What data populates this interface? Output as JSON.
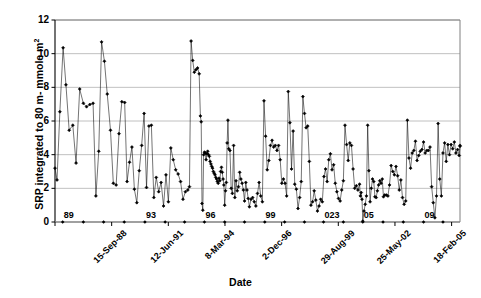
{
  "chart_data": {
    "type": "line",
    "title": "",
    "xlabel": "Date",
    "ylabel": "SRP integrated to 80 m- mmole m2",
    "ylabel_base": "SRP integrated to 80 m- mmole m",
    "ylabel_sup": "2",
    "ylim": [
      0,
      12
    ],
    "ytick_values": [
      0,
      2,
      4,
      6,
      8,
      10,
      12
    ],
    "ytick_labels": [
      "0",
      "2",
      "4",
      "6",
      "8",
      "10",
      "12"
    ],
    "grid": true,
    "grid_axis": "y",
    "legend": "none",
    "marker": "filled-diamond",
    "line_color": "#000000",
    "marker_color": "#000000",
    "grid_color": "#b0b0b0",
    "axis_color": "#808080",
    "xtick_labels": [
      "15-Sep-88",
      "12-Jun-91",
      "8-Mar-94",
      "2-Dec-96",
      "29-Aug-99",
      "25-May-02",
      "18-Feb-05",
      "15-Nov-07"
    ],
    "xtick_positions_frac": [
      0.0,
      0.1399,
      0.2798,
      0.4197,
      0.5596,
      0.6995,
      0.8394,
      0.9793
    ],
    "year_annotations": [
      {
        "label": "89",
        "x_frac": 0.019
      },
      {
        "label": "93",
        "x_frac": 0.222
      },
      {
        "label": "96",
        "x_frac": 0.369
      },
      {
        "label": "99",
        "x_frac": 0.5175
      },
      {
        "label": "023",
        "x_frac": 0.663
      },
      {
        "label": "05",
        "x_frac": 0.76
      },
      {
        "label": "09",
        "x_frac": 0.91
      }
    ],
    "axis_year_ticks_frac": [
      0.019,
      0.07,
      0.12,
      0.171,
      0.222,
      0.272,
      0.32,
      0.369,
      0.419,
      0.468,
      0.518,
      0.567,
      0.616,
      0.663,
      0.712,
      0.76,
      0.81,
      0.86,
      0.91,
      0.958
    ],
    "n_points": 248,
    "x_frac": [
      0.0,
      0.005,
      0.012,
      0.02,
      0.027,
      0.035,
      0.044,
      0.052,
      0.061,
      0.07,
      0.078,
      0.086,
      0.094,
      0.101,
      0.108,
      0.115,
      0.122,
      0.129,
      0.137,
      0.144,
      0.151,
      0.158,
      0.165,
      0.172,
      0.178,
      0.184,
      0.19,
      0.196,
      0.202,
      0.208,
      0.214,
      0.22,
      0.226,
      0.232,
      0.238,
      0.244,
      0.25,
      0.256,
      0.262,
      0.268,
      0.274,
      0.28,
      0.286,
      0.292,
      0.298,
      0.304,
      0.31,
      0.316,
      0.322,
      0.328,
      0.332,
      0.336,
      0.34,
      0.344,
      0.348,
      0.352,
      0.356,
      0.359,
      0.361,
      0.363,
      0.365,
      0.367,
      0.369,
      0.371,
      0.373,
      0.375,
      0.377,
      0.379,
      0.381,
      0.383,
      0.385,
      0.387,
      0.389,
      0.391,
      0.393,
      0.395,
      0.397,
      0.399,
      0.401,
      0.403,
      0.405,
      0.407,
      0.409,
      0.411,
      0.413,
      0.415,
      0.417,
      0.419,
      0.421,
      0.423,
      0.425,
      0.427,
      0.429,
      0.432,
      0.435,
      0.438,
      0.441,
      0.444,
      0.447,
      0.45,
      0.453,
      0.456,
      0.459,
      0.462,
      0.465,
      0.468,
      0.471,
      0.474,
      0.477,
      0.48,
      0.484,
      0.488,
      0.492,
      0.496,
      0.5,
      0.504,
      0.508,
      0.512,
      0.516,
      0.52,
      0.524,
      0.528,
      0.532,
      0.536,
      0.54,
      0.544,
      0.548,
      0.552,
      0.556,
      0.56,
      0.564,
      0.568,
      0.572,
      0.576,
      0.58,
      0.584,
      0.588,
      0.592,
      0.596,
      0.6,
      0.604,
      0.608,
      0.612,
      0.616,
      0.62,
      0.624,
      0.628,
      0.632,
      0.636,
      0.64,
      0.644,
      0.648,
      0.652,
      0.656,
      0.66,
      0.664,
      0.668,
      0.672,
      0.676,
      0.68,
      0.684,
      0.688,
      0.692,
      0.696,
      0.7,
      0.704,
      0.708,
      0.712,
      0.716,
      0.72,
      0.724,
      0.728,
      0.732,
      0.736,
      0.74,
      0.744,
      0.748,
      0.752,
      0.754,
      0.756,
      0.758,
      0.76,
      0.763,
      0.766,
      0.769,
      0.772,
      0.775,
      0.778,
      0.781,
      0.784,
      0.787,
      0.79,
      0.793,
      0.796,
      0.799,
      0.802,
      0.805,
      0.808,
      0.811,
      0.814,
      0.818,
      0.822,
      0.826,
      0.83,
      0.834,
      0.838,
      0.842,
      0.846,
      0.85,
      0.854,
      0.858,
      0.862,
      0.866,
      0.87,
      0.874,
      0.878,
      0.882,
      0.886,
      0.89,
      0.894,
      0.898,
      0.902,
      0.906,
      0.91,
      0.914,
      0.918,
      0.922,
      0.926,
      0.93,
      0.934,
      0.938,
      0.942,
      0.946,
      0.95,
      0.954,
      0.958,
      0.962,
      0.966,
      0.97,
      0.974,
      0.978,
      0.982,
      0.986,
      0.99,
      0.994,
      0.998,
      1.0,
      1.0
    ],
    "values": [
      3.2,
      2.5,
      6.55,
      10.35,
      8.15,
      5.45,
      5.75,
      3.5,
      7.9,
      7.05,
      6.85,
      6.98,
      7.05,
      1.55,
      4.2,
      10.7,
      9.55,
      7.6,
      5.45,
      2.3,
      2.2,
      5.25,
      7.15,
      7.1,
      2.4,
      3.55,
      4.45,
      1.95,
      1.15,
      3.05,
      4.55,
      6.45,
      2.05,
      5.7,
      5.75,
      1.45,
      2.65,
      1.8,
      2.35,
      0.95,
      2.8,
      1.2,
      4.4,
      3.7,
      3.1,
      2.85,
      2.4,
      1.35,
      1.8,
      1.9,
      2.1,
      10.75,
      9.6,
      8.9,
      9.05,
      9.15,
      8.8,
      6.3,
      5.95,
      1.1,
      0.7,
      4.0,
      4.15,
      4.1,
      3.7,
      4.05,
      4.2,
      4.0,
      3.9,
      3.6,
      3.45,
      3.3,
      3.2,
      3.0,
      2.9,
      2.8,
      2.65,
      2.55,
      2.4,
      2.3,
      2.6,
      2.45,
      3.0,
      3.25,
      2.95,
      2.55,
      2.2,
      1.0,
      1.85,
      2.35,
      4.7,
      6.05,
      4.35,
      4.25,
      2.0,
      1.7,
      4.55,
      1.45,
      2.45,
      1.85,
      2.1,
      2.95,
      2.55,
      2.3,
      1.9,
      1.25,
      2.35,
      1.9,
      1.4,
      0.9,
      1.35,
      1.45,
      1.2,
      0.95,
      1.7,
      2.35,
      1.55,
      1.2,
      7.2,
      5.1,
      3.1,
      3.65,
      4.55,
      4.85,
      4.45,
      4.55,
      4.25,
      4.55,
      3.7,
      2.3,
      2.55,
      2.3,
      1.55,
      7.75,
      5.9,
      3.15,
      5.4,
      2.25,
      1.95,
      0.8,
      1.45,
      2.4,
      7.45,
      6.45,
      5.6,
      5.7,
      3.6,
      1.0,
      1.2,
      1.85,
      1.3,
      0.65,
      0.95,
      1.35,
      1.2,
      2.7,
      3.15,
      2.4,
      3.7,
      4.05,
      3.1,
      3.4,
      2.3,
      1.8,
      1.4,
      1.25,
      1.9,
      2.45,
      5.75,
      4.6,
      3.65,
      4.7,
      4.55,
      3.15,
      2.0,
      2.15,
      1.9,
      2.25,
      1.55,
      1.75,
      1.35,
      0.05,
      0.65,
      1.05,
      1.55,
      5.75,
      3.05,
      1.2,
      2.0,
      2.55,
      2.4,
      1.5,
      1.45,
      1.85,
      2.2,
      2.45,
      2.3,
      2.55,
      1.5,
      1.6,
      1.6,
      1.55,
      2.2,
      3.35,
      3.0,
      2.8,
      3.3,
      2.75,
      1.9,
      2.5,
      1.45,
      1.05,
      1.25,
      6.05,
      3.8,
      3.2,
      4.1,
      4.25,
      4.8,
      3.65,
      3.95,
      4.2,
      4.3,
      4.75,
      4.1,
      4.25,
      4.25,
      4.45,
      2.1,
      1.15,
      0.25,
      1.55,
      5.85,
      2.55,
      1.55,
      4.1,
      4.7,
      3.6,
      4.6,
      4.0,
      4.6,
      4.35,
      4.75,
      4.1,
      4.3,
      3.95,
      4.5,
      4.55
    ]
  }
}
